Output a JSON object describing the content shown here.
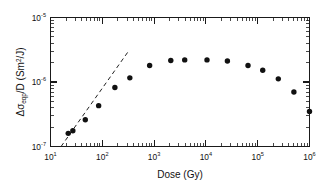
{
  "chart_data": {
    "type": "scatter",
    "title": "",
    "xlabel": "Dose (Gy)",
    "ylabel": "Δσeqp/D (Sm²/J)",
    "ylabel_parts": {
      "delta": "Δ",
      "sigma": "σ",
      "subscript": "eqp",
      "divisor": "/D (Sm",
      "superscript": "2",
      "tail": "/J)"
    },
    "xscale": "log",
    "yscale": "log",
    "xlim": [
      10,
      1000000
    ],
    "ylim": [
      1e-07,
      1e-05
    ],
    "grid": false,
    "legend": null,
    "x_tick_labels": [
      {
        "base": "10",
        "exp": "1",
        "value": 10
      },
      {
        "base": "10",
        "exp": "2",
        "value": 100
      },
      {
        "base": "10",
        "exp": "3",
        "value": 1000
      },
      {
        "base": "10",
        "exp": "4",
        "value": 10000
      },
      {
        "base": "10",
        "exp": "5",
        "value": 100000
      },
      {
        "base": "10",
        "exp": "6",
        "value": 1000000
      }
    ],
    "y_tick_labels": [
      {
        "base": "10",
        "exp": "-7",
        "value": 1e-07
      },
      {
        "base": "10",
        "exp": "-6",
        "value": 1e-06
      },
      {
        "base": "10",
        "exp": "-5",
        "value": 1e-05
      }
    ],
    "series": [
      {
        "name": "measured",
        "marker": "filled-circle",
        "color": "#111111",
        "x": [
          22,
          27,
          47,
          85,
          175,
          340,
          820,
          2100,
          3900,
          10500,
          26000,
          65000,
          125000,
          250000,
          500000,
          1000000
        ],
        "y": [
          1.6e-07,
          1.75e-07,
          2.6e-07,
          4.3e-07,
          8.2e-07,
          1.16e-06,
          1.8e-06,
          2.15e-06,
          2.2e-06,
          2.2e-06,
          2.12e-06,
          1.8e-06,
          1.52e-06,
          1.12e-06,
          7e-07,
          3.5e-07
        ]
      }
    ],
    "annotations": [
      {
        "type": "dashed-line",
        "name": "linear-fit-guide",
        "x_start": 16,
        "y_start": 1e-07,
        "x_end": 320,
        "y_end": 3e-06,
        "style": "dashed"
      }
    ]
  },
  "axes": {
    "tick_direction": "in",
    "frame": "full-box",
    "minor_ticks": true
  }
}
